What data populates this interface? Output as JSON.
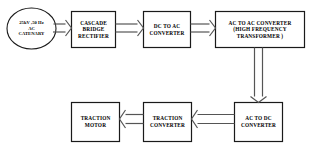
{
  "diagram": {
    "colors": {
      "stroke": "#1a1a1a",
      "fill": "#ffffff",
      "text": "#000000",
      "background": "#ffffff"
    },
    "nodes": [
      {
        "id": "source",
        "shape": "ellipse",
        "name": "ac-catenary-source",
        "lines": [
          "25kV ,50 Hz",
          "AC",
          "CATENARY"
        ]
      },
      {
        "id": "rectifier",
        "shape": "rect",
        "name": "cascade-bridge-rectifier",
        "lines": [
          "CASCADE",
          "BRIDGE",
          "RECTIFIER"
        ]
      },
      {
        "id": "dc-ac",
        "shape": "rect",
        "name": "dc-to-ac-converter",
        "lines": [
          "DC TO AC",
          "CONVERTER"
        ]
      },
      {
        "id": "ac-ac",
        "shape": "rect",
        "name": "ac-to-ac-converter",
        "lines": [
          "AC TO AC CONVERTER",
          "(HIGH FREQUENCY",
          "TRANSFORMER )"
        ]
      },
      {
        "id": "ac-dc",
        "shape": "rect",
        "name": "ac-to-dc-converter",
        "lines": [
          "AC TO DC",
          "CONVERTER"
        ]
      },
      {
        "id": "traction-converter",
        "shape": "rect",
        "name": "traction-converter",
        "lines": [
          "TRACTION",
          "CONVERTER"
        ]
      },
      {
        "id": "traction-motor",
        "shape": "rect",
        "name": "traction-motor",
        "lines": [
          "TRACTION",
          "MOTOR"
        ]
      }
    ],
    "connections": [
      {
        "from": "source",
        "to": "rectifier",
        "direction": "right",
        "style": "hollow-arrow"
      },
      {
        "from": "rectifier",
        "to": "dc-ac",
        "direction": "right",
        "style": "hollow-arrow"
      },
      {
        "from": "dc-ac",
        "to": "ac-ac",
        "direction": "right",
        "style": "hollow-arrow"
      },
      {
        "from": "ac-ac",
        "to": "ac-dc",
        "direction": "down",
        "style": "hollow-arrow"
      },
      {
        "from": "ac-dc",
        "to": "traction-converter",
        "direction": "left",
        "style": "hollow-arrow"
      },
      {
        "from": "traction-converter",
        "to": "traction-motor",
        "direction": "left",
        "style": "hollow-arrow"
      }
    ]
  }
}
